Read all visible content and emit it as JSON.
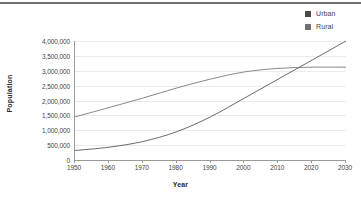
{
  "chart_data": {
    "type": "line",
    "title": "",
    "xlabel": "Year",
    "ylabel": "Population",
    "xlim": [
      1950,
      2030
    ],
    "ylim": [
      0,
      4000000
    ],
    "grid": true,
    "legend_position": "top-right",
    "x": [
      1950,
      1960,
      1970,
      1980,
      1990,
      2000,
      2010,
      2020,
      2030
    ],
    "xtick_labels": [
      "1950",
      "1960",
      "1970",
      "1980",
      "1990",
      "2000",
      "2010",
      "2020",
      "2030"
    ],
    "ytick_values": [
      0,
      500000,
      1000000,
      1500000,
      2000000,
      2500000,
      3000000,
      3500000,
      4000000
    ],
    "ytick_labels": [
      "0",
      "500,000",
      "1,000,000",
      "1,500,000",
      "2,000,000",
      "2,500,000",
      "3,000,000",
      "3,500,000",
      "4,000,000"
    ],
    "series": [
      {
        "name": "Urban",
        "color": "#595959",
        "values": [
          320000,
          430000,
          620000,
          950000,
          1450000,
          2080000,
          2720000,
          3360000,
          4000000
        ]
      },
      {
        "name": "Rural",
        "color": "#7a7a7a",
        "values": [
          1450000,
          1760000,
          2080000,
          2420000,
          2720000,
          2960000,
          3080000,
          3120000,
          3120000
        ]
      }
    ],
    "annotations": [
      {
        "text": "series crossover",
        "x": 2017,
        "y": 3110000
      }
    ]
  },
  "legend": {
    "items": [
      {
        "label": "Urban",
        "color": "#4a4a4a",
        "swatch": "square-marker"
      },
      {
        "label": "Rural",
        "color": "#707070",
        "swatch": "square-marker"
      }
    ]
  },
  "axes": {
    "x_title": "Year",
    "y_title": "Population"
  }
}
